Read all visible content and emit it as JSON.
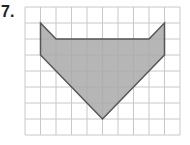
{
  "problem": {
    "number_label": "7."
  },
  "grid": {
    "cols": 10,
    "rows": 8,
    "origin_x": 25,
    "origin_y": 7,
    "cell_w": 15.5,
    "cell_h": 16,
    "line_color": "#c8c8c8"
  },
  "shape": {
    "fill_color": "#a9a9a9",
    "stroke_color": "#555555",
    "vertices": [
      [
        1,
        1
      ],
      [
        2,
        2
      ],
      [
        8,
        2
      ],
      [
        9,
        1
      ],
      [
        9,
        3
      ],
      [
        5,
        7
      ],
      [
        1,
        3
      ]
    ]
  }
}
